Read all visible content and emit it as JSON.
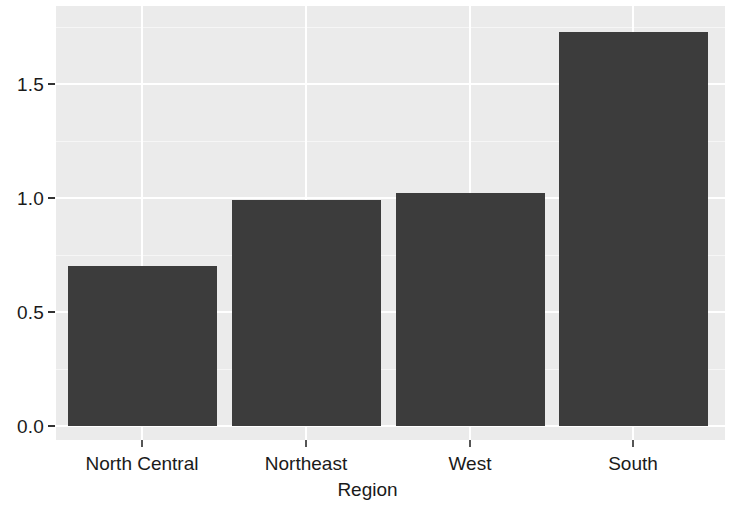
{
  "chart_data": {
    "type": "bar",
    "title": "",
    "xlabel": "Region",
    "ylabel": "",
    "categories": [
      "North Central",
      "Northeast",
      "West",
      "South"
    ],
    "values": [
      0.7,
      0.99,
      1.02,
      1.73
    ],
    "ylim": [
      0.0,
      1.82
    ],
    "y_ticks": [
      0.0,
      0.5,
      1.0,
      1.5
    ],
    "y_tick_labels": [
      "0.0",
      "0.5",
      "1.0",
      "1.5"
    ],
    "y_minor_ticks": [
      0.25,
      0.75,
      1.25,
      1.75
    ],
    "grid": true,
    "legend": "none",
    "bar_color": "#3c3c3c",
    "panel_color": "#ebebeb",
    "gridline_color": "#ffffff"
  },
  "axes": {
    "y_labels": [
      "1.5",
      "1.0",
      "0.5",
      "0.0"
    ],
    "x_labels": [
      "North Central",
      "Northeast",
      "West",
      "South"
    ],
    "x_title": "Region"
  }
}
